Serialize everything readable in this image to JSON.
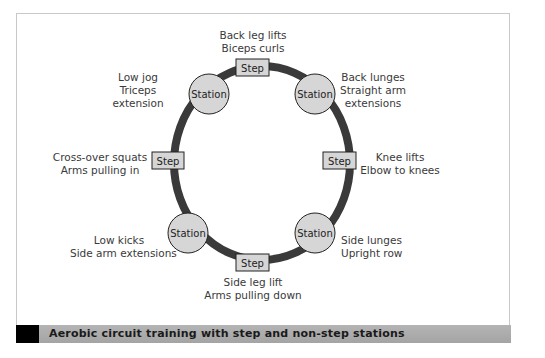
{
  "caption": "Aerobic circuit training with step and non-step stations",
  "colors": {
    "ring": "#3a3a3a",
    "node_fill": "#d6d6d6",
    "node_stroke": "#222222",
    "caption_bar": "#ababab",
    "caption_mark": "#000000"
  },
  "nodes": [
    {
      "id": "top",
      "type": "Step",
      "label": "Step",
      "lines": [
        "Back leg lifts",
        "Biceps curls"
      ]
    },
    {
      "id": "top-right",
      "type": "Station",
      "label": "Station",
      "lines": [
        "Back lunges",
        "Straight arm",
        "extensions"
      ]
    },
    {
      "id": "right",
      "type": "Step",
      "label": "Step",
      "lines": [
        "Knee lifts",
        "Elbow to knees"
      ]
    },
    {
      "id": "bottom-right",
      "type": "Station",
      "label": "Station",
      "lines": [
        "Side lunges",
        "Upright row"
      ]
    },
    {
      "id": "bottom",
      "type": "Step",
      "label": "Step",
      "lines": [
        "Side leg lift",
        "Arms pulling down"
      ]
    },
    {
      "id": "bottom-left",
      "type": "Station",
      "label": "Station",
      "lines": [
        "Low kicks",
        "Side arm extensions"
      ]
    },
    {
      "id": "left",
      "type": "Step",
      "label": "Step",
      "lines": [
        "Cross-over squats",
        "Arms pulling in"
      ]
    },
    {
      "id": "top-left",
      "type": "Station",
      "label": "Station",
      "lines": [
        "Low jog",
        "Triceps",
        "extension"
      ]
    }
  ]
}
